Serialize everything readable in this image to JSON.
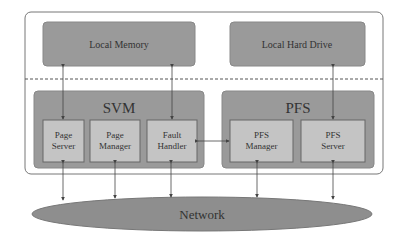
{
  "diagram": {
    "top_boxes": {
      "local_memory": "Local Memory",
      "local_hard_drive": "Local Hard Drive"
    },
    "svm": {
      "title": "SVM",
      "page_server": [
        "Page",
        "Server"
      ],
      "page_manager": [
        "Page",
        "Manager"
      ],
      "fault_handler": [
        "Fault",
        "Handler"
      ]
    },
    "pfs": {
      "title": "PFS",
      "pfs_manager": [
        "PFS",
        "Manager"
      ],
      "pfs_server": [
        "PFS",
        "Server"
      ]
    },
    "network": "Network",
    "colors": {
      "outer_frame": "#ffffff",
      "dark_box": "#9a9a9a",
      "inner_box": "#c4c4c4",
      "network": "#8e8e8e",
      "line": "#555555"
    }
  }
}
